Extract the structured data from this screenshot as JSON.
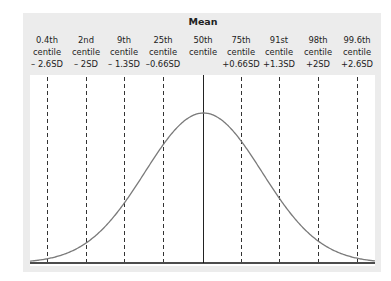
{
  "chart_data": {
    "type": "line",
    "title": "Mean",
    "xlabel": "",
    "ylabel": "",
    "grid": false,
    "legend": null,
    "reference_lines": [
      {
        "centile": "0.4th",
        "sd": "– 2.6SD",
        "sd_value": -2.6,
        "style": "dashed"
      },
      {
        "centile": "2nd",
        "sd": "– 2SD",
        "sd_value": -2.0,
        "style": "dashed"
      },
      {
        "centile": "9th",
        "sd": "– 1.3SD",
        "sd_value": -1.33,
        "style": "dashed"
      },
      {
        "centile": "25th",
        "sd": "–0.66SD",
        "sd_value": -0.67,
        "style": "dashed"
      },
      {
        "centile": "50th",
        "sd": "",
        "sd_value": 0,
        "style": "solid"
      },
      {
        "centile": "75th",
        "sd": "+0.66SD",
        "sd_value": 0.67,
        "style": "dashed"
      },
      {
        "centile": "91st",
        "sd": "+1.3SD",
        "sd_value": 1.33,
        "style": "dashed"
      },
      {
        "centile": "98th",
        "sd": "+2SD",
        "sd_value": 2.0,
        "style": "dashed"
      },
      {
        "centile": "99.6th",
        "sd": "+2.6SD",
        "sd_value": 2.6,
        "style": "dashed"
      }
    ],
    "x_range_sd": [
      -3.0,
      3.0
    ],
    "curve": "standard normal pdf"
  },
  "labels": {
    "title": "Mean",
    "columns": [
      {
        "l1": "0.4th",
        "l2": "centile",
        "l3": "– 2.6SD"
      },
      {
        "l1": "2nd",
        "l2": "centile",
        "l3": "– 2SD"
      },
      {
        "l1": "9th",
        "l2": "centile",
        "l3": "– 1.3SD"
      },
      {
        "l1": "25th",
        "l2": "centile",
        "l3": "–0.66SD"
      },
      {
        "l1": "50th",
        "l2": "centile",
        "l3": ""
      },
      {
        "l1": "75th",
        "l2": "centile",
        "l3": "+0.66SD"
      },
      {
        "l1": "91st",
        "l2": "centile",
        "l3": "+1.3SD"
      },
      {
        "l1": "98th",
        "l2": "centile",
        "l3": "+2SD"
      },
      {
        "l1": "99.6th",
        "l2": "centile",
        "l3": "+2.6SD"
      }
    ]
  },
  "colors": {
    "panel": "#ececec",
    "plot": "#ffffff",
    "curve": "#7a7a7a",
    "axis": "#111111",
    "dashed": "#333333"
  }
}
